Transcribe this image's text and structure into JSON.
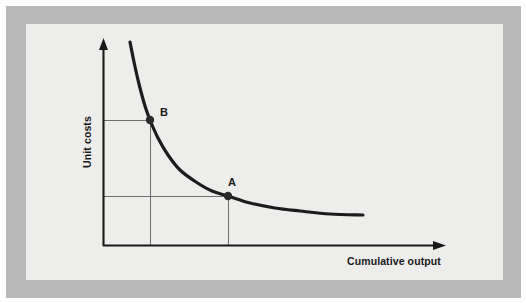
{
  "figure": {
    "kind": "experience-curve-diagram",
    "frame": {
      "outer_background": "#ffffff",
      "border_band_color": "#b9b9b9",
      "panel_color": "#ededec"
    }
  },
  "axes": {
    "y_label": "Unit costs",
    "x_label": "Cumulative output",
    "origin": {
      "x": 103,
      "y": 246
    },
    "y_axis_top": 40,
    "x_axis_right": 445,
    "arrow_heads": true,
    "tick_labels": [],
    "grid": "guide-lines-only"
  },
  "points": [
    {
      "id": "B",
      "label": "B",
      "x": 150,
      "y": 120,
      "label_offset_x": 10,
      "label_offset_y": -4,
      "description": "Higher unit cost at lower cumulative output"
    },
    {
      "id": "A",
      "label": "A",
      "x": 228,
      "y": 196,
      "label_offset_x": 4,
      "label_offset_y": -10,
      "description": "Lower unit cost at higher cumulative output"
    }
  ],
  "chart_data": {
    "type": "line",
    "title": "",
    "subtitle": "",
    "xlabel": "Cumulative output",
    "ylabel": "Unit costs",
    "xlim": [
      103,
      445
    ],
    "ylim": [
      246,
      40
    ],
    "grid": false,
    "legend": "none",
    "axis_tick_labels": {
      "x": [],
      "y": []
    },
    "series": [
      {
        "name": "Experience curve",
        "stroke": "#1c1c1c",
        "points": [
          {
            "x": 130,
            "y": 42
          },
          {
            "x": 134,
            "y": 62
          },
          {
            "x": 139,
            "y": 84
          },
          {
            "x": 145,
            "y": 106
          },
          {
            "x": 150,
            "y": 120
          },
          {
            "x": 158,
            "y": 138
          },
          {
            "x": 168,
            "y": 155
          },
          {
            "x": 180,
            "y": 170
          },
          {
            "x": 196,
            "y": 182
          },
          {
            "x": 212,
            "y": 191
          },
          {
            "x": 228,
            "y": 196
          },
          {
            "x": 250,
            "y": 203
          },
          {
            "x": 275,
            "y": 208
          },
          {
            "x": 300,
            "y": 211
          },
          {
            "x": 330,
            "y": 214
          },
          {
            "x": 363,
            "y": 215
          }
        ]
      }
    ],
    "annotations": [
      {
        "label": "B",
        "x": 150,
        "y": 120
      },
      {
        "label": "A",
        "x": 228,
        "y": 196
      }
    ],
    "guide_lines": [
      {
        "from": [
          103,
          120
        ],
        "to": [
          150,
          120
        ],
        "orientation": "horizontal",
        "for_point": "B"
      },
      {
        "from": [
          150,
          120
        ],
        "to": [
          150,
          246
        ],
        "orientation": "vertical",
        "for_point": "B"
      },
      {
        "from": [
          103,
          196
        ],
        "to": [
          228,
          196
        ],
        "orientation": "horizontal",
        "for_point": "A"
      },
      {
        "from": [
          228,
          196
        ],
        "to": [
          228,
          246
        ],
        "orientation": "vertical",
        "for_point": "A"
      }
    ]
  }
}
